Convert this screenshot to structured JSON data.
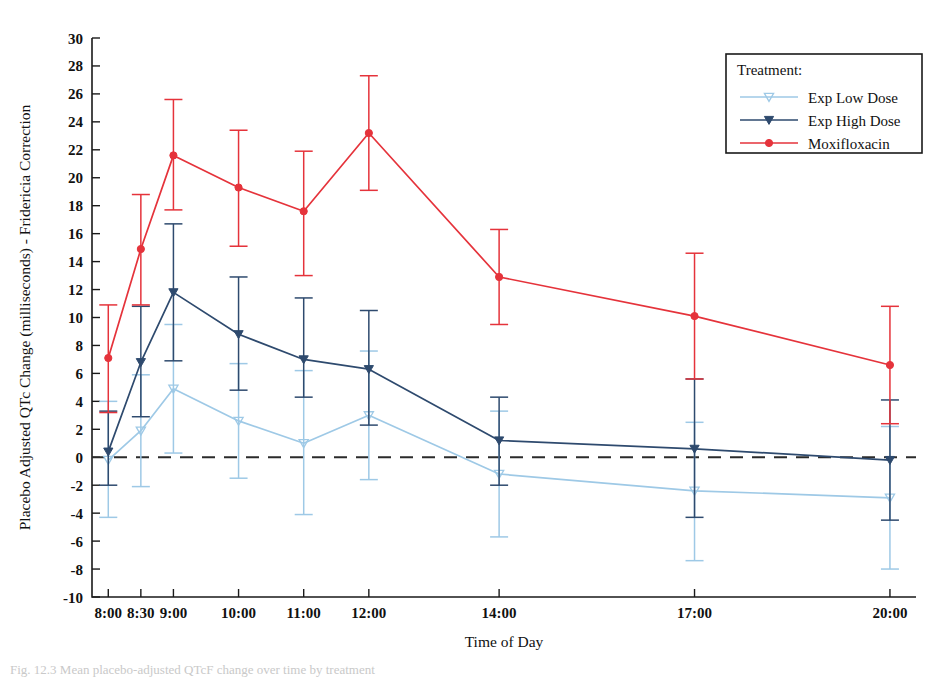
{
  "figure": {
    "caption": "Fig. 12.3  Mean placebo-adjusted QTcF change over time by treatment"
  },
  "chart_data": {
    "type": "line",
    "title": "",
    "xlabel": "Time of Day",
    "ylabel": "Placebo Adjusted QTc Change (milliseconds) - Fridericia Correction",
    "categories": [
      "8:00",
      "8:30",
      "9:00",
      "10:00",
      "11:00",
      "12:00",
      "14:00",
      "17:00",
      "20:00"
    ],
    "x_positions_hours": [
      8.0,
      8.5,
      9.0,
      10.0,
      11.0,
      12.0,
      14.0,
      17.0,
      20.0
    ],
    "xlim_hours": [
      7.75,
      20.4
    ],
    "ylim": [
      -10,
      30
    ],
    "ytick_step": 2,
    "yticks": [
      -10,
      -8,
      -6,
      -4,
      -2,
      0,
      2,
      4,
      6,
      8,
      10,
      12,
      14,
      16,
      18,
      20,
      22,
      24,
      26,
      28,
      30
    ],
    "grid": false,
    "zero_reference_line": 0,
    "legend_position": "top-right",
    "legend_title": "Treatment:",
    "series": [
      {
        "name": "Exp Low Dose",
        "color": "#9ec9e6",
        "marker": "triangle-down-open",
        "values": [
          -0.2,
          1.9,
          4.9,
          2.6,
          1.0,
          3.0,
          -1.2,
          -2.4,
          -2.9
        ],
        "err_low": [
          -4.3,
          -2.1,
          0.3,
          -1.5,
          -4.1,
          -1.6,
          -5.7,
          -7.4,
          -8.0
        ],
        "err_high": [
          4.0,
          5.9,
          9.5,
          6.7,
          6.2,
          7.6,
          3.3,
          2.5,
          2.2
        ]
      },
      {
        "name": "Exp High Dose",
        "color": "#2e4a6e",
        "marker": "triangle-down-filled",
        "values": [
          0.4,
          6.8,
          11.8,
          8.8,
          7.0,
          6.3,
          1.2,
          0.6,
          -0.2
        ],
        "err_low": [
          -2.0,
          2.9,
          6.9,
          4.8,
          4.3,
          2.3,
          -2.0,
          -4.3,
          -4.5
        ],
        "err_high": [
          3.3,
          10.8,
          16.7,
          12.9,
          11.4,
          10.5,
          4.3,
          5.6,
          4.1
        ]
      },
      {
        "name": "Moxifloxacin",
        "color": "#e5333b",
        "marker": "circle-filled",
        "values": [
          7.1,
          14.9,
          21.6,
          19.3,
          17.6,
          23.2,
          12.9,
          10.1,
          6.6
        ],
        "err_low": [
          3.2,
          10.9,
          17.7,
          15.1,
          13.0,
          19.1,
          9.5,
          5.6,
          2.4
        ],
        "err_high": [
          10.9,
          18.8,
          25.6,
          23.4,
          21.9,
          27.3,
          16.3,
          14.6,
          10.8
        ]
      }
    ]
  }
}
